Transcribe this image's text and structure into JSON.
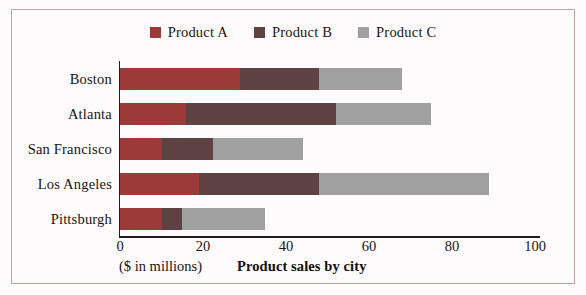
{
  "chart_data": {
    "type": "bar",
    "orientation": "horizontal",
    "stacked": true,
    "title": "Product sales by city",
    "xlabel": "Product sales by city",
    "ylabel": "",
    "unit_note": "($ in millions)",
    "categories": [
      "Boston",
      "Atlanta",
      "San Francisco",
      "Los Angeles",
      "Pittsburgh"
    ],
    "series": [
      {
        "name": "Product A",
        "color": "#9b3a38",
        "values": [
          29,
          16,
          10,
          19,
          10
        ]
      },
      {
        "name": "Product B",
        "color": "#5e4244",
        "values": [
          19,
          36,
          12.5,
          29,
          5
        ]
      },
      {
        "name": "Product C",
        "color": "#a0a0a0",
        "values": [
          20,
          23,
          21.5,
          41,
          20
        ]
      }
    ],
    "totals": [
      68,
      75,
      44,
      89,
      35
    ],
    "xlim": [
      0,
      100
    ],
    "xticks": [
      0,
      20,
      40,
      60,
      80,
      100
    ],
    "xtick_labels": [
      "0",
      "20",
      "40",
      "60",
      "80",
      "100"
    ],
    "grid": false,
    "legend_position": "top-center"
  },
  "legend": {
    "items": [
      {
        "label": "Product A",
        "color": "#9b3a38"
      },
      {
        "label": "Product B",
        "color": "#5e4244"
      },
      {
        "label": "Product C",
        "color": "#a0a0a0"
      }
    ]
  },
  "axis": {
    "unit_note": "($ in millions)",
    "x_title": "Product sales by city"
  },
  "colors": {
    "frame": "#c4a3a6",
    "background": "#fdfbfb",
    "axis": "#231c1c",
    "text": "#1a1414"
  }
}
